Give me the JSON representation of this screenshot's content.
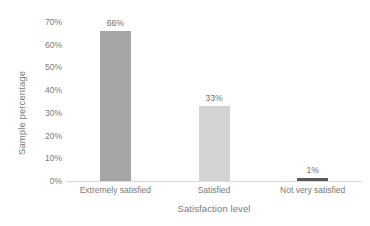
{
  "chart_data": {
    "type": "bar",
    "title": "",
    "xlabel": "Satisfaction level",
    "ylabel": "Sample percentage",
    "categories": [
      "Extremely satisfied",
      "Satisfied",
      "Not very satisfied"
    ],
    "values": [
      66,
      33,
      1
    ],
    "data_labels": [
      "66%",
      "33%",
      "1%"
    ],
    "ylim": [
      0,
      70
    ],
    "ytick_values": [
      0,
      10,
      20,
      30,
      40,
      50,
      60,
      70
    ],
    "ytick_labels": [
      "0%",
      "10%",
      "20%",
      "30%",
      "40%",
      "50%",
      "60%",
      "70%"
    ],
    "grid": false,
    "legend": false,
    "bar_colors": [
      "#a6a6a6",
      "#d3d3d3",
      "#595959"
    ],
    "axis_color": "#d9d9d9",
    "text_color": "#7a7a7a",
    "background": "#ffffff"
  }
}
